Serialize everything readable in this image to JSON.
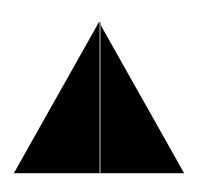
{
  "figure": {
    "width": 198,
    "height": 187,
    "background": "#ffffff",
    "shape": {
      "type": "triangle",
      "fill": "#000000",
      "points": [
        [
          99,
          22
        ],
        [
          14,
          173
        ],
        [
          184,
          173
        ]
      ]
    },
    "divider": {
      "type": "vertical-line",
      "stroke": "#7a7a7a",
      "stroke_width": 1.6,
      "x": 100,
      "y1": 22,
      "y2": 173
    },
    "base_edge": {
      "stroke": "#bfbfbf",
      "y": 173.5
    }
  }
}
